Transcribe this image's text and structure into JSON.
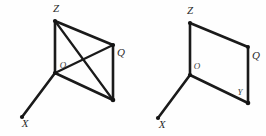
{
  "canvas": {
    "width": 266,
    "height": 136,
    "background": "#fefefe",
    "stroke_color": "#1a1a1a",
    "label_color": "#2a2a2a"
  },
  "figures": [
    {
      "id": "left-figure",
      "name": "parallelogram-with-diagonals",
      "vertices": {
        "O": {
          "x": 55,
          "y": 73,
          "label": "O",
          "label_x": 63,
          "label_y": 66
        },
        "Z": {
          "x": 55,
          "y": 21,
          "label": "Z",
          "label_x": 56,
          "label_y": 9
        },
        "Q": {
          "x": 113,
          "y": 45,
          "label": "Q",
          "label_x": 121,
          "label_y": 53
        },
        "Y": {
          "x": 113,
          "y": 100,
          "label": "",
          "label_x": 105,
          "label_y": 92
        },
        "X": {
          "x": 22,
          "y": 117,
          "label": "X",
          "label_x": 25,
          "label_y": 124
        }
      },
      "edges": [
        {
          "name": "axis-OZ",
          "from": "O",
          "to": "Z"
        },
        {
          "name": "axis-OY",
          "from": "O",
          "to": "Y"
        },
        {
          "name": "axis-OX",
          "from": "O",
          "to": "X"
        },
        {
          "name": "edge-ZQ",
          "from": "Z",
          "to": "Q"
        },
        {
          "name": "edge-QY",
          "from": "Q",
          "to": "Y"
        },
        {
          "name": "diagonal-ZY",
          "from": "Z",
          "to": "Y"
        },
        {
          "name": "diagonal-OQ",
          "from": "O",
          "to": "Q"
        }
      ]
    },
    {
      "id": "right-figure",
      "name": "parallelogram-plain",
      "vertices": {
        "O": {
          "x": 190,
          "y": 75,
          "label": "O",
          "label_x": 197,
          "label_y": 67
        },
        "Z": {
          "x": 190,
          "y": 23,
          "label": "Z",
          "label_x": 190,
          "label_y": 11
        },
        "Q": {
          "x": 248,
          "y": 47,
          "label": "Q",
          "label_x": 256,
          "label_y": 56
        },
        "Y": {
          "x": 248,
          "y": 103,
          "label": "Y",
          "label_x": 240,
          "label_y": 93
        },
        "X": {
          "x": 158,
          "y": 118,
          "label": "X",
          "label_x": 162,
          "label_y": 125
        }
      },
      "edges": [
        {
          "name": "axis-OZ",
          "from": "O",
          "to": "Z"
        },
        {
          "name": "axis-OY",
          "from": "O",
          "to": "Y"
        },
        {
          "name": "axis-OX",
          "from": "O",
          "to": "X"
        },
        {
          "name": "edge-ZQ",
          "from": "Z",
          "to": "Q"
        },
        {
          "name": "edge-QY",
          "from": "Q",
          "to": "Y"
        }
      ]
    }
  ],
  "labels": {
    "left_Z": "Z",
    "left_Q": "Q",
    "left_O": "O",
    "left_X": "X",
    "right_Z": "Z",
    "right_Q": "Q",
    "right_O": "O",
    "right_Y": "Y",
    "right_X": "X"
  }
}
